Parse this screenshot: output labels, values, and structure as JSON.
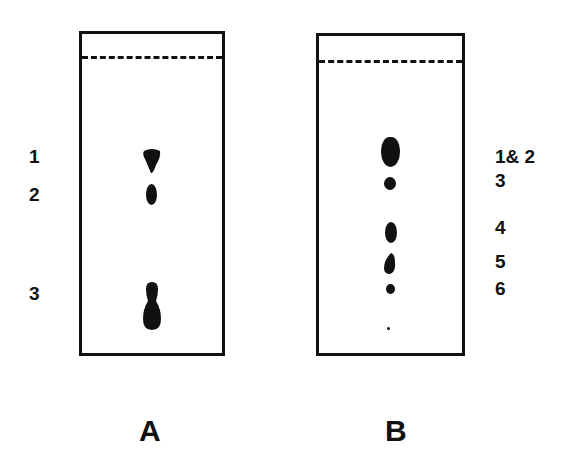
{
  "figure": {
    "panels": [
      {
        "id": "A",
        "caption": "A",
        "spot_labels": [
          "1",
          "2",
          "3"
        ]
      },
      {
        "id": "B",
        "caption": "B",
        "spot_labels": [
          "1& 2",
          "3",
          "4",
          "5",
          "6"
        ]
      }
    ]
  }
}
